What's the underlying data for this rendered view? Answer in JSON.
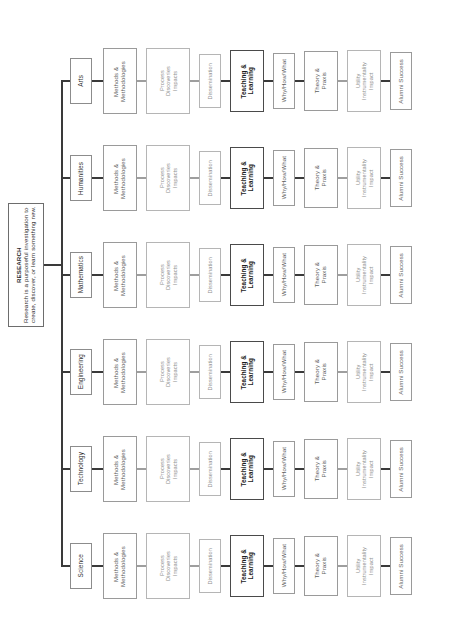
{
  "figure": {
    "title": "RESEARCH",
    "orientation": "rotated-90",
    "root": {
      "heading": "RESEARCH",
      "description": "Research is a purposeful investigation to create, discover, or learn something new."
    },
    "disciplines": [
      {
        "label": "Arts"
      },
      {
        "label": "Humanities"
      },
      {
        "label": "Mathematics"
      },
      {
        "label": "Engineering"
      },
      {
        "label": "Technology"
      },
      {
        "label": "Science"
      }
    ],
    "stages": [
      {
        "label": "Methods &\nMethodologies",
        "emphasis": "mid"
      },
      {
        "label": "Process\nDiscoveries\nImpacts",
        "emphasis": "faint"
      },
      {
        "label": "Dissemination",
        "emphasis": "faint"
      },
      {
        "label": "Teaching &\nLearning",
        "emphasis": "strong"
      },
      {
        "label": "Why/How/What",
        "emphasis": "mid"
      },
      {
        "label": "Theory &\nPraxis",
        "emphasis": "mid"
      },
      {
        "label": "Utility\nInstrumentality\nImpact",
        "emphasis": "faint"
      },
      {
        "label": "Alumni Success",
        "emphasis": "mid"
      }
    ],
    "caption": ""
  }
}
